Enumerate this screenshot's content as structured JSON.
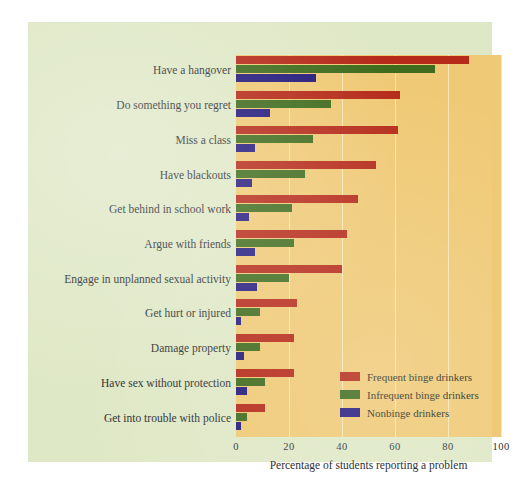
{
  "chart_data": {
    "type": "bar",
    "orientation": "horizontal",
    "title": "",
    "xlabel": "Percentage of students reporting a problem",
    "ylabel": "",
    "xlim": [
      0,
      100
    ],
    "xticks": [
      "0",
      "20",
      "40",
      "60",
      "80",
      "100"
    ],
    "grid": true,
    "legend_position": "inside-bottom-right",
    "categories": [
      "Have a hangover",
      "Do something you regret",
      "Miss a class",
      "Have blackouts",
      "Get behind in school work",
      "Argue with friends",
      "Engage in unplanned sexual activity",
      "Get hurt or injured",
      "Damage property",
      "Have sex without protection",
      "Get into trouble with police"
    ],
    "series": [
      {
        "name": "Frequent binge drinkers",
        "color": "#b52a19",
        "values": [
          88,
          62,
          61,
          53,
          46,
          42,
          40,
          23,
          22,
          22,
          11
        ]
      },
      {
        "name": "Infrequent binge drinkers",
        "color": "#3f6b1c",
        "values": [
          75,
          36,
          29,
          26,
          21,
          22,
          20,
          9,
          9,
          11,
          4
        ]
      },
      {
        "name": "Nonbinge drinkers",
        "color": "#241a7c",
        "values": [
          30,
          13,
          7,
          6,
          5,
          7,
          8,
          2,
          3,
          4,
          2
        ]
      }
    ]
  },
  "colors": {
    "page_background": "#ffffff",
    "panel_background": "#dfe8c6",
    "plot_background": "#efc975",
    "gridline": "#f6e6b4",
    "text": "#2e3033",
    "frequent": "#b52a19",
    "infrequent": "#3f6b1c",
    "nonbinge": "#241a7c"
  }
}
